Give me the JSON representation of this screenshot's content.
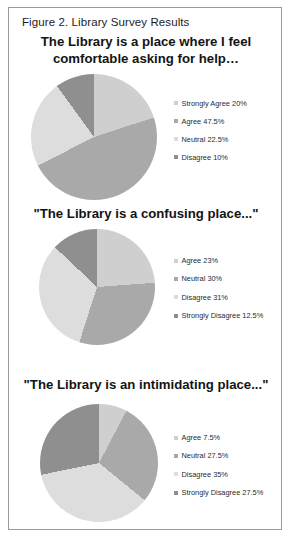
{
  "figure": {
    "caption": "Figure 2. Library Survey Results"
  },
  "palette": {
    "slice_1": "#cfcfcf",
    "slice_2": "#a9a9a9",
    "slice_3": "#dddddd",
    "slice_4": "#8f8f8f",
    "frame_border": "#9a9a9a",
    "text": "#141414",
    "background": "#ffffff"
  },
  "charts": [
    {
      "title": "The Library is a place where I feel comfortable asking for help…",
      "legend": [
        {
          "label": "Strongly Agree 20%",
          "swatch": "#cfcfcf"
        },
        {
          "label": "Agree 47.5%",
          "swatch": "#a9a9a9"
        },
        {
          "label": "Neutral 22.5%",
          "swatch": "#dddddd"
        },
        {
          "label": "Disagree 10%",
          "swatch": "#8f8f8f"
        }
      ]
    },
    {
      "title": "\"The Library is a confusing place...\"",
      "legend": [
        {
          "label": "Agree 23%",
          "swatch": "#cfcfcf"
        },
        {
          "label": "Neutral 30%",
          "swatch": "#a9a9a9"
        },
        {
          "label": "Disagree 31%",
          "swatch": "#dddddd"
        },
        {
          "label": "Strongly Disagree 12.5%",
          "swatch": "#8f8f8f"
        }
      ]
    },
    {
      "title": "\"The Library is an intimidating place...\"",
      "legend": [
        {
          "label": "Agree 7.5%",
          "swatch": "#cfcfcf"
        },
        {
          "label": "Neutral 27.5%",
          "swatch": "#a9a9a9"
        },
        {
          "label": "Disagree 35%",
          "swatch": "#dddddd"
        },
        {
          "label": "Strongly Disagree 27.5%",
          "swatch": "#8f8f8f"
        }
      ]
    }
  ],
  "chart_data": [
    {
      "type": "pie",
      "title": "The Library is a place where I feel comfortable asking for help…",
      "categories": [
        "Strongly Agree",
        "Agree",
        "Neutral",
        "Disagree"
      ],
      "values": [
        20,
        47.5,
        22.5,
        10
      ],
      "unit": "percent",
      "colors": [
        "#cfcfcf",
        "#a9a9a9",
        "#dddddd",
        "#8f8f8f"
      ],
      "legend_position": "right",
      "start_angle": 0
    },
    {
      "type": "pie",
      "title": "\"The Library is a confusing place...\"",
      "categories": [
        "Agree",
        "Neutral",
        "Disagree",
        "Strongly Disagree"
      ],
      "values": [
        23,
        30,
        31,
        12.5
      ],
      "unit": "percent",
      "colors": [
        "#cfcfcf",
        "#a9a9a9",
        "#dddddd",
        "#8f8f8f"
      ],
      "legend_position": "right",
      "start_angle": 0
    },
    {
      "type": "pie",
      "title": "\"The Library is an intimidating place...\"",
      "categories": [
        "Agree",
        "Neutral",
        "Disagree",
        "Strongly Disagree"
      ],
      "values": [
        7.5,
        27.5,
        35,
        27.5
      ],
      "unit": "percent",
      "colors": [
        "#cfcfcf",
        "#a9a9a9",
        "#dddddd",
        "#8f8f8f"
      ],
      "legend_position": "right",
      "start_angle": 0
    }
  ]
}
